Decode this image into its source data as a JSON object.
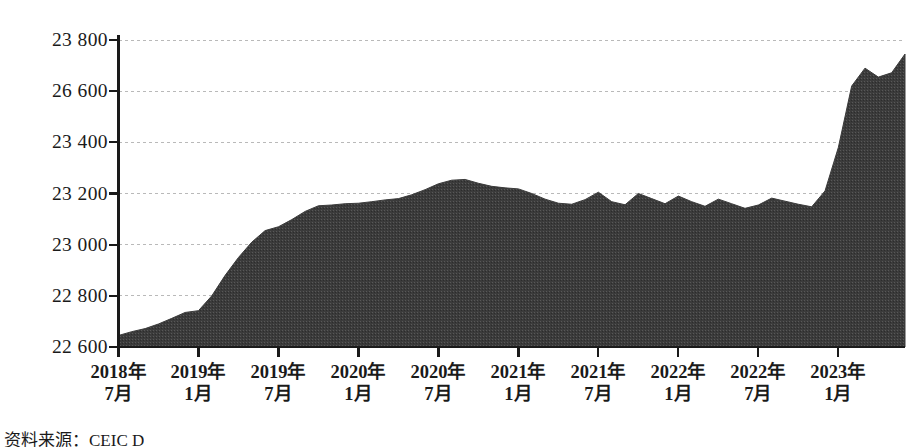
{
  "chart_data": {
    "type": "area",
    "title": "",
    "subtitle": "",
    "xlabel": "",
    "ylabel": "",
    "grid": true,
    "legend": false,
    "ylim": [
      22600,
      23800
    ],
    "y_ticks": [
      22600,
      22800,
      23000,
      23200,
      23400,
      26600,
      23800
    ],
    "y_tick_labels": [
      "22 600",
      "22 800",
      "23 000",
      "23 200",
      "23 400",
      "26 600",
      "23 800"
    ],
    "x_tick_labels": [
      {
        "year": "2018年",
        "month": "7月"
      },
      {
        "year": "2019年",
        "month": "1月"
      },
      {
        "year": "2019年",
        "month": "7月"
      },
      {
        "year": "2020年",
        "month": "1月"
      },
      {
        "year": "2020年",
        "month": "7月"
      },
      {
        "year": "2021年",
        "month": "1月"
      },
      {
        "year": "2021年",
        "month": "7月"
      },
      {
        "year": "2022年",
        "month": "1月"
      },
      {
        "year": "2022年",
        "month": "7月"
      },
      {
        "year": "2023年",
        "month": "1月"
      }
    ],
    "x": [
      "2018-07",
      "2018-08",
      "2018-09",
      "2018-10",
      "2018-11",
      "2018-12",
      "2019-01",
      "2019-02",
      "2019-03",
      "2019-04",
      "2019-05",
      "2019-06",
      "2019-07",
      "2019-08",
      "2019-09",
      "2019-10",
      "2019-11",
      "2019-12",
      "2020-01",
      "2020-02",
      "2020-03",
      "2020-04",
      "2020-05",
      "2020-06",
      "2020-07",
      "2020-08",
      "2020-09",
      "2020-10",
      "2020-11",
      "2020-12",
      "2021-01",
      "2021-02",
      "2021-03",
      "2021-04",
      "2021-05",
      "2021-06",
      "2021-07",
      "2021-08",
      "2021-09",
      "2021-10",
      "2021-11",
      "2021-12",
      "2022-01",
      "2022-02",
      "2022-03",
      "2022-04",
      "2022-05",
      "2022-06",
      "2022-07",
      "2022-08",
      "2022-09",
      "2022-10",
      "2022-11",
      "2022-12",
      "2023-01",
      "2023-02",
      "2023-03",
      "2023-04",
      "2023-05",
      "2023-06"
    ],
    "values": [
      22645,
      22660,
      22672,
      22690,
      22712,
      22735,
      22742,
      22800,
      22880,
      22950,
      23010,
      23055,
      23070,
      23098,
      23130,
      23152,
      23155,
      23160,
      23162,
      23168,
      23175,
      23180,
      23195,
      23215,
      23238,
      23252,
      23255,
      23240,
      23228,
      23222,
      23218,
      23200,
      23178,
      23162,
      23158,
      23176,
      23205,
      23168,
      23156,
      23200,
      23180,
      23160,
      23190,
      23168,
      23150,
      23178,
      23160,
      23142,
      23155,
      23182,
      23170,
      23158,
      23148,
      23210,
      23380,
      23620,
      23690,
      23655,
      23672,
      23745
    ],
    "series_name": "",
    "fill_color": "#3b3b3b",
    "axis_color": "#1a1a1a",
    "grid_color": "#b9b9b9",
    "background": "#ffffff"
  },
  "footer": {
    "source_text": "资料来源：CEIC D"
  }
}
